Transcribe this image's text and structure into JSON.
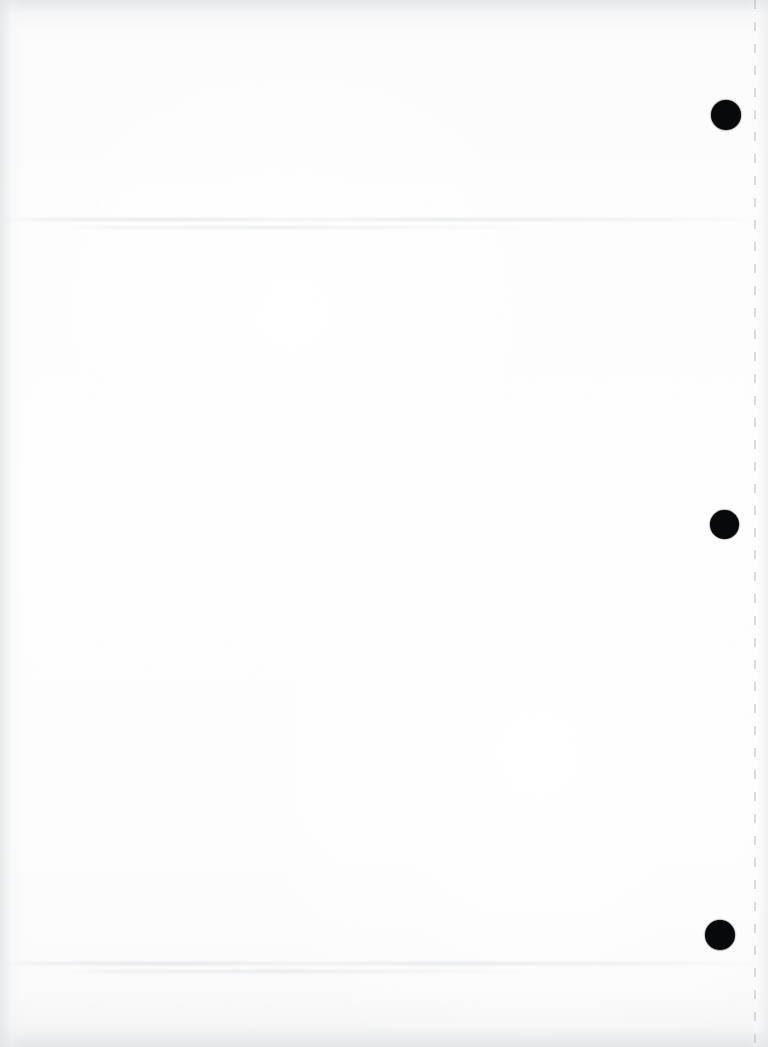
{
  "document": {
    "type": "scanned-page",
    "title": "Scanned blank page",
    "description": "Blank white scanned sheet with three black circular registration marks along the right margin and a faint vertical perforation line near the right edge.",
    "page_width": 768,
    "page_height": 1047,
    "orientation": "portrait",
    "body_text": "",
    "visible_text_count": 0
  },
  "colors": {
    "paper": "#fdfdfd",
    "paper_edge": "#f1f2f3",
    "mark": "#08090a",
    "perforation": "#b0b4b8",
    "showthrough": "#c8ccd0"
  },
  "registration_marks": {
    "label": "registration-mark",
    "count": 3,
    "shape": "circle",
    "color": "#08090a",
    "items": [
      {
        "id": "mark-1",
        "cx": 726,
        "cy": 115,
        "diameter": 30
      },
      {
        "id": "mark-2",
        "cx": 724,
        "cy": 524,
        "diameter": 29
      },
      {
        "id": "mark-3",
        "cx": 720,
        "cy": 935,
        "diameter": 30
      }
    ]
  },
  "perforation": {
    "label": "perforation-line",
    "orientation": "vertical",
    "x": 754,
    "dash_length": 9,
    "gap_length": 13,
    "color": "#b0b4b8"
  },
  "show_through": [
    {
      "id": "band-top",
      "y": 218,
      "label": "faint-text-show-through"
    },
    {
      "id": "band-bottom",
      "y": 962,
      "label": "faint-text-show-through"
    }
  ]
}
